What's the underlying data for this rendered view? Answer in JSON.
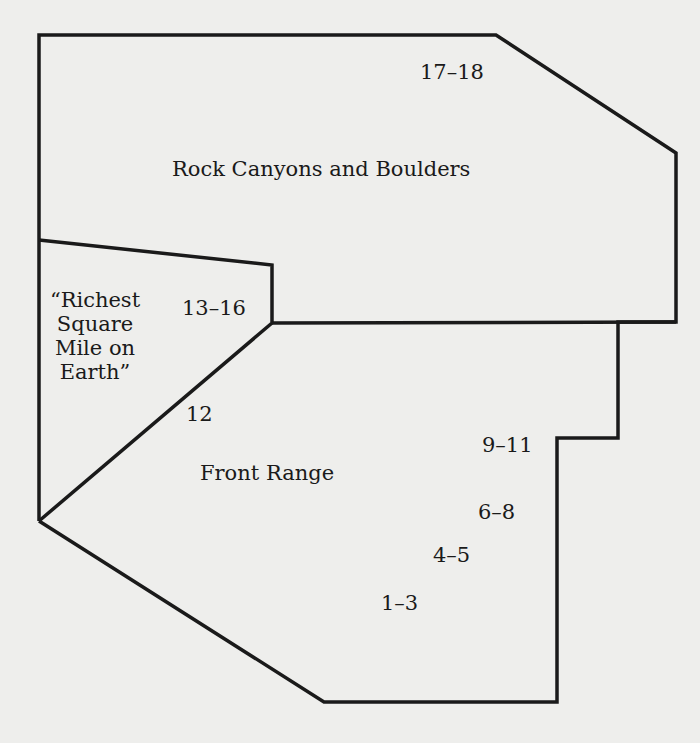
{
  "diagram": {
    "stroke_color": "#1a1a1a",
    "background_color": "#eeeeec",
    "regions": [
      {
        "name": "Rock Canyons and Boulders",
        "chapters": "17–18"
      },
      {
        "name": "“Richest Square Mile on Earth”",
        "chapters": "13–16"
      },
      {
        "name": "Front Range",
        "chapters": [
          "12",
          "9–11",
          "6–8",
          "4–5",
          "1–3"
        ]
      }
    ],
    "labels": {
      "rock_canyons": "Rock Canyons and Boulders",
      "richest_line1": "“Richest",
      "richest_line2": "Square",
      "richest_line3": "Mile on",
      "richest_line4": "Earth”",
      "front_range": "Front Range",
      "ch_17_18": "17–18",
      "ch_13_16": "13–16",
      "ch_12": "12",
      "ch_9_11": "9–11",
      "ch_6_8": "6–8",
      "ch_4_5": "4–5",
      "ch_1_3": "1–3"
    }
  }
}
